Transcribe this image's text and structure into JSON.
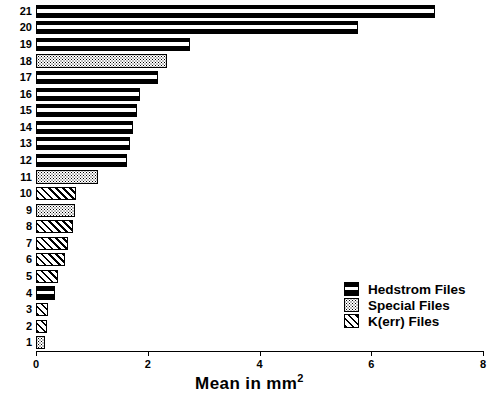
{
  "chart_data": {
    "type": "bar",
    "orientation": "horizontal",
    "title": "",
    "subtitle": "",
    "xlabel": "Mean in mm2",
    "ylabel": "",
    "xlim": [
      0,
      8
    ],
    "xticks": [
      0,
      2,
      4,
      6,
      8
    ],
    "xticklabels": [
      "0",
      "2",
      "4",
      "6",
      "8"
    ],
    "grid": false,
    "legend_position": "lower-right",
    "categories": [
      "1",
      "2",
      "3",
      "4",
      "5",
      "6",
      "7",
      "8",
      "9",
      "10",
      "11",
      "12",
      "13",
      "14",
      "15",
      "16",
      "17",
      "18",
      "19",
      "20",
      "21"
    ],
    "values": [
      0.16,
      0.2,
      0.21,
      0.34,
      0.39,
      0.52,
      0.57,
      0.66,
      0.7,
      0.72,
      1.11,
      1.63,
      1.68,
      1.74,
      1.81,
      1.86,
      2.18,
      2.34,
      2.75,
      5.76,
      7.14
    ],
    "group_of_category": [
      "special",
      "kerr",
      "kerr",
      "hedstrom",
      "kerr",
      "kerr",
      "kerr",
      "kerr",
      "special",
      "kerr",
      "special",
      "hedstrom",
      "hedstrom",
      "hedstrom",
      "hedstrom",
      "hedstrom",
      "hedstrom",
      "special",
      "hedstrom",
      "hedstrom",
      "hedstrom"
    ],
    "bars": [
      {
        "category": "21",
        "value": 7.14,
        "group": "hedstrom"
      },
      {
        "category": "20",
        "value": 5.76,
        "group": "hedstrom"
      },
      {
        "category": "19",
        "value": 2.75,
        "group": "hedstrom"
      },
      {
        "category": "18",
        "value": 2.34,
        "group": "special"
      },
      {
        "category": "17",
        "value": 2.18,
        "group": "hedstrom"
      },
      {
        "category": "16",
        "value": 1.86,
        "group": "hedstrom"
      },
      {
        "category": "15",
        "value": 1.81,
        "group": "hedstrom"
      },
      {
        "category": "14",
        "value": 1.74,
        "group": "hedstrom"
      },
      {
        "category": "13",
        "value": 1.68,
        "group": "hedstrom"
      },
      {
        "category": "12",
        "value": 1.63,
        "group": "hedstrom"
      },
      {
        "category": "11",
        "value": 1.11,
        "group": "special"
      },
      {
        "category": "10",
        "value": 0.72,
        "group": "kerr"
      },
      {
        "category": "9",
        "value": 0.7,
        "group": "special"
      },
      {
        "category": "8",
        "value": 0.66,
        "group": "kerr"
      },
      {
        "category": "7",
        "value": 0.57,
        "group": "kerr"
      },
      {
        "category": "6",
        "value": 0.52,
        "group": "kerr"
      },
      {
        "category": "5",
        "value": 0.39,
        "group": "kerr"
      },
      {
        "category": "4",
        "value": 0.34,
        "group": "hedstrom"
      },
      {
        "category": "3",
        "value": 0.21,
        "group": "kerr"
      },
      {
        "category": "2",
        "value": 0.2,
        "group": "kerr"
      },
      {
        "category": "1",
        "value": 0.16,
        "group": "special"
      }
    ],
    "series": [
      {
        "name": "Hedstrom Files",
        "pattern": "black-with-white-band"
      },
      {
        "name": "Special Files",
        "pattern": "stipple-dots"
      },
      {
        "name": "K(err) Files",
        "pattern": "diagonal-hatch"
      }
    ]
  },
  "axis": {
    "x_title_main": "Mean in mm",
    "x_title_sup": "2",
    "tick_labels": [
      "0",
      "2",
      "4",
      "6",
      "8"
    ],
    "y_tick_labels": [
      "21",
      "20",
      "19",
      "18",
      "17",
      "16",
      "15",
      "14",
      "13",
      "12",
      "11",
      "10",
      "9",
      "8",
      "7",
      "6",
      "5",
      "4",
      "3",
      "2",
      "1"
    ]
  },
  "legend": {
    "items": [
      {
        "label": "Hedstrom Files",
        "group": "hedstrom"
      },
      {
        "label": "Special Files",
        "group": "special"
      },
      {
        "label": "K(err) Files",
        "group": "kerr"
      }
    ]
  },
  "colors": {
    "ink": "#000000",
    "background": "#ffffff"
  }
}
